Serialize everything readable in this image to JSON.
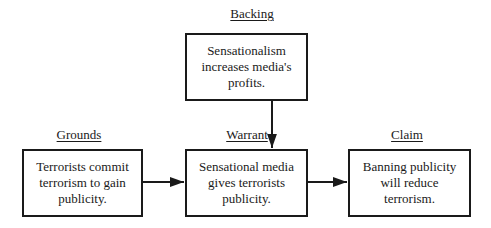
{
  "diagram": {
    "type": "toulmin-argument-model",
    "nodes": {
      "backing": {
        "label": "Backing",
        "text": "Sensationalism increases media's profits."
      },
      "grounds": {
        "label": "Grounds",
        "text": "Terrorists commit terrorism to gain publicity."
      },
      "warrant": {
        "label": "Warrant",
        "text": "Sensational media gives terrorists publicity."
      },
      "claim": {
        "label": "Claim",
        "text": "Banning publicity will reduce terrorism."
      }
    },
    "edges": [
      {
        "from": "backing",
        "to": "warrant"
      },
      {
        "from": "grounds",
        "to": "warrant"
      },
      {
        "from": "warrant",
        "to": "claim"
      }
    ],
    "colors": {
      "stroke": "#1a1a1a",
      "background": "#ffffff"
    }
  }
}
